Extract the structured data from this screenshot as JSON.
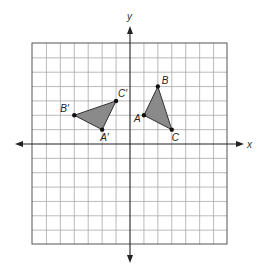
{
  "diagram": {
    "title": "",
    "grid": {
      "x_min": -7,
      "x_max": 7,
      "y_min": -7,
      "y_max": 7,
      "step": 1
    },
    "axes": {
      "x_label": "x",
      "y_label": "y"
    },
    "colors": {
      "fill": "#8a8a8a",
      "grid": "#a8a8a8",
      "border": "#555555",
      "axis": "#222222"
    },
    "triangles": [
      {
        "name": "triangle-abc",
        "vertices": [
          {
            "label": "A",
            "x": 1,
            "y": 2
          },
          {
            "label": "B",
            "x": 2,
            "y": 4
          },
          {
            "label": "C",
            "x": 3,
            "y": 1
          }
        ]
      },
      {
        "name": "triangle-abc-prime",
        "vertices": [
          {
            "label": "A′",
            "x": -2,
            "y": 1
          },
          {
            "label": "B′",
            "x": -4,
            "y": 2
          },
          {
            "label": "C′",
            "x": -1,
            "y": 3
          }
        ]
      }
    ],
    "labels": {
      "A": "A",
      "B": "B",
      "C": "C",
      "A_prime": "A′",
      "B_prime": "B′",
      "C_prime": "C′"
    }
  }
}
